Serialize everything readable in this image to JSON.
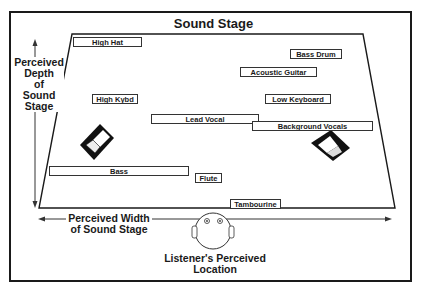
{
  "title": "Sound Stage",
  "axes": {
    "depth_label": [
      "Perceived",
      "Depth",
      "of",
      "Sound",
      "Stage"
    ],
    "width_label": [
      "Perceived Width",
      "of Sound Stage"
    ],
    "listener_label": [
      "Listener's Perceived",
      "Location"
    ]
  },
  "instruments": [
    {
      "name": "High Hat",
      "x": 73,
      "y": 37,
      "w": 69
    },
    {
      "name": "Bass Drum",
      "x": 290,
      "y": 49,
      "w": 52
    },
    {
      "name": "Acoustic Guitar",
      "x": 240,
      "y": 67,
      "w": 77
    },
    {
      "name": "High Kybd",
      "x": 92,
      "y": 94,
      "w": 46
    },
    {
      "name": "Low Keyboard",
      "x": 265,
      "y": 94,
      "w": 66
    },
    {
      "name": "Lead Vocal",
      "x": 151,
      "y": 114,
      "w": 108
    },
    {
      "name": "Background Vocals",
      "x": 252,
      "y": 121,
      "w": 121
    },
    {
      "name": "Bass",
      "x": 49,
      "y": 166,
      "w": 140
    },
    {
      "name": "Flute",
      "x": 195,
      "y": 173,
      "w": 27
    },
    {
      "name": "Tambourine",
      "x": 230,
      "y": 199,
      "w": 51
    }
  ],
  "colors": {
    "ink": "#1a1a1a",
    "background": "#ffffff"
  }
}
